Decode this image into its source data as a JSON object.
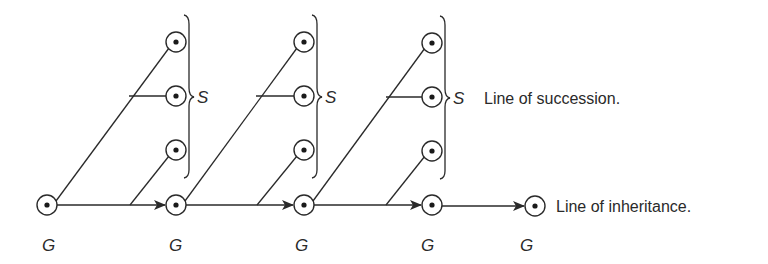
{
  "diagram": {
    "colors": {
      "ink": "#2a2a2a",
      "background": "#ffffff"
    },
    "generation_label": "G",
    "succession_label": "S",
    "caption_succession": "Line of succession.",
    "caption_inheritance": "Line of inheritance.",
    "generations": [
      {
        "label": "G",
        "x": 47
      },
      {
        "label": "G",
        "x": 176
      },
      {
        "label": "G",
        "x": 304
      },
      {
        "label": "G",
        "x": 432
      },
      {
        "label": "G",
        "x": 535
      }
    ],
    "succession_groups": [
      {
        "label": "S",
        "column_x": 176
      },
      {
        "label": "S",
        "column_x": 304
      },
      {
        "label": "S",
        "column_x": 432
      }
    ]
  }
}
